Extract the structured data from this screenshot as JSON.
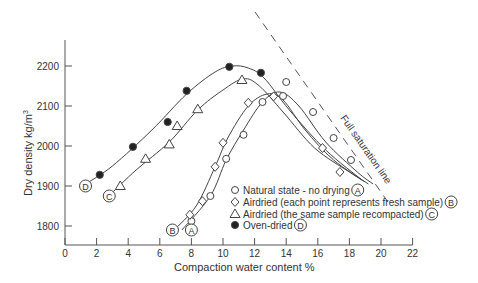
{
  "chart_data": {
    "type": "scatter",
    "title": "",
    "xlabel": "Compaction water content %",
    "ylabel": "Dry density kg/m³",
    "xlim": [
      0,
      22
    ],
    "ylim": [
      1750,
      2270
    ],
    "xticks": [
      0,
      2,
      4,
      6,
      8,
      10,
      12,
      14,
      16,
      18,
      20,
      22
    ],
    "yticks": [
      1800,
      1900,
      2000,
      2100,
      2200
    ],
    "grid": false,
    "legend_position": "lower right (inside)",
    "series": [
      {
        "name": "Natural state - no drying",
        "tag": "A",
        "marker": "circle-open",
        "points": [
          [
            8.0,
            1812
          ],
          [
            9.2,
            1875
          ],
          [
            10.2,
            1968
          ],
          [
            11.3,
            2028
          ],
          [
            12.5,
            2110
          ],
          [
            13.8,
            2125
          ],
          [
            14.0,
            2160
          ],
          [
            15.7,
            2085
          ],
          [
            17.0,
            2020
          ],
          [
            18.1,
            1965
          ]
        ]
      },
      {
        "name": "Airdried (each point represents fresh sample)",
        "tag": "B",
        "marker": "diamond-open",
        "points": [
          [
            7.9,
            1828
          ],
          [
            8.7,
            1862
          ],
          [
            9.5,
            1948
          ],
          [
            10.0,
            2008
          ],
          [
            11.6,
            2108
          ],
          [
            13.2,
            2124
          ],
          [
            16.3,
            1995
          ],
          [
            17.4,
            1935
          ]
        ]
      },
      {
        "name": "Airdried (the same sample recompacted)",
        "tag": "C",
        "marker": "triangle-open",
        "points": [
          [
            3.5,
            1900
          ],
          [
            5.1,
            1968
          ],
          [
            6.6,
            2004
          ],
          [
            7.1,
            2050
          ],
          [
            8.4,
            2092
          ],
          [
            11.2,
            2165
          ]
        ]
      },
      {
        "name": "Oven-dried",
        "tag": "D",
        "marker": "circle-filled",
        "points": [
          [
            2.2,
            1928
          ],
          [
            4.3,
            1998
          ],
          [
            6.5,
            2060
          ],
          [
            7.7,
            2138
          ],
          [
            10.4,
            2198
          ],
          [
            12.4,
            2183
          ]
        ]
      }
    ],
    "annotations": [
      {
        "text": "Full saturation line",
        "type": "dashed-line",
        "from": [
          12.0,
          2320
        ],
        "to": [
          20.0,
          1900
        ]
      },
      {
        "text": "A",
        "at": [
          8.0,
          1790
        ]
      },
      {
        "text": "B",
        "at": [
          6.8,
          1790
        ]
      },
      {
        "text": "C",
        "at": [
          2.8,
          1875
        ]
      },
      {
        "text": "D",
        "at": [
          1.3,
          1900
        ]
      }
    ]
  },
  "labels": {
    "xlabel": "Compaction water content %",
    "ylabel": "Dry density kg/m",
    "ylabel_sup": "3",
    "saturation": "Full saturation line",
    "legend": [
      {
        "text": "Natural state - no drying",
        "tag": "A"
      },
      {
        "text": "Airdried (each point represents fresh sample)",
        "tag": "B"
      },
      {
        "text": "Airdried (the same sample recompacted)",
        "tag": "C"
      },
      {
        "text": "Oven-dried",
        "tag": "D"
      }
    ],
    "tags": {
      "A": "A",
      "B": "B",
      "C": "C",
      "D": "D"
    }
  },
  "colors": {
    "ink": "#333333",
    "axis": "#555555"
  }
}
